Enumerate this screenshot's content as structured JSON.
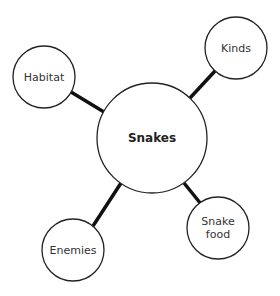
{
  "diagram": {
    "type": "mind-map",
    "center": {
      "label": "Snakes",
      "cx": 152,
      "cy": 138,
      "r": 55
    },
    "nodes": [
      {
        "label": "Habitat",
        "cx": 44,
        "cy": 77,
        "r": 31
      },
      {
        "label": "Kinds",
        "cx": 236,
        "cy": 48,
        "r": 31
      },
      {
        "label": "Enemies",
        "cx": 73,
        "cy": 250,
        "r": 31
      },
      {
        "label": "Snake food",
        "line1": "Snake",
        "line2": "food",
        "cx": 218,
        "cy": 228,
        "r": 31
      }
    ],
    "colors": {
      "stroke": "#222222",
      "connector": "#111111",
      "text": "#333333",
      "background": "#ffffff"
    }
  }
}
